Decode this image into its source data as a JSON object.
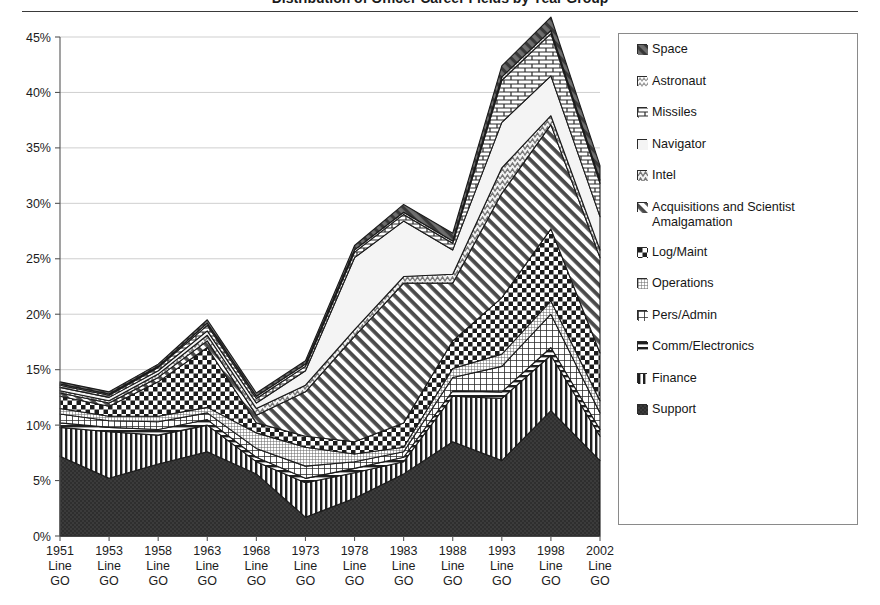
{
  "title": "Distribution of Officer Career Fields by Year Group",
  "yaxis": {
    "ticks": [
      "0%",
      "5%",
      "10%",
      "15%",
      "20%",
      "25%",
      "30%",
      "35%",
      "40%",
      "45%"
    ],
    "min": 0,
    "max": 45
  },
  "xaxis": {
    "ticks": [
      {
        "year": "1951",
        "line1": "Line",
        "line2": "GO"
      },
      {
        "year": "1953",
        "line1": "Line",
        "line2": "GO"
      },
      {
        "year": "1958",
        "line1": "Line",
        "line2": "GO"
      },
      {
        "year": "1963",
        "line1": "Line",
        "line2": "GO"
      },
      {
        "year": "1968",
        "line1": "Line",
        "line2": "GO"
      },
      {
        "year": "1973",
        "line1": "Line",
        "line2": "GO"
      },
      {
        "year": "1978",
        "line1": "Line",
        "line2": "GO"
      },
      {
        "year": "1983",
        "line1": "Line",
        "line2": "GO"
      },
      {
        "year": "1988",
        "line1": "Line",
        "line2": "GO"
      },
      {
        "year": "1993",
        "line1": "Line",
        "line2": "GO"
      },
      {
        "year": "1998",
        "line1": "Line",
        "line2": "GO"
      },
      {
        "year": "2002",
        "line1": "Line",
        "line2": "GO"
      }
    ]
  },
  "legend": {
    "items": [
      {
        "label": "Space",
        "pattern": "diag-dark-fill"
      },
      {
        "label": "Astronaut",
        "pattern": "zigzag-light"
      },
      {
        "label": "Missiles",
        "pattern": "brick"
      },
      {
        "label": "Navigator",
        "pattern": "solid-white"
      },
      {
        "label": "Intel",
        "pattern": "zigzag-grey"
      },
      {
        "label": "Acquisitions and Scientist\nAmalgamation",
        "pattern": "diag-stripe"
      },
      {
        "label": "Log/Maint",
        "pattern": "checker"
      },
      {
        "label": "Operations",
        "pattern": "grid-fine"
      },
      {
        "label": "Pers/Admin",
        "pattern": "grid-coarse"
      },
      {
        "label": "Comm/Electronics",
        "pattern": "horiz-stripe"
      },
      {
        "label": "Finance",
        "pattern": "vert-stripe"
      },
      {
        "label": "Support",
        "pattern": "solid-dark"
      }
    ]
  },
  "chart_data": {
    "type": "area",
    "stacked": true,
    "title": "Distribution of Officer Career Fields by Year Group",
    "xlabel": "",
    "ylabel": "",
    "ylim": [
      0,
      45
    ],
    "grid": true,
    "legend_position": "right",
    "categories": [
      "1951 Line GO",
      "1953 Line GO",
      "1958 Line GO",
      "1963 Line GO",
      "1968 Line GO",
      "1973 Line GO",
      "1978 Line GO",
      "1983 Line GO",
      "1988 Line GO",
      "1993 Line GO",
      "1998 Line GO",
      "2002 Line GO"
    ],
    "x": [
      "1951",
      "1953",
      "1958",
      "1963",
      "1968",
      "1973",
      "1978",
      "1983",
      "1988",
      "1993",
      "1998",
      "2002"
    ],
    "stack_order_bottom_to_top": [
      "Support",
      "Finance",
      "Comm/Electronics",
      "Pers/Admin",
      "Operations",
      "Log/Maint",
      "Acquisitions and Scientist Amalgamation",
      "Intel",
      "Navigator",
      "Missiles",
      "Astronaut",
      "Space"
    ],
    "series": [
      {
        "name": "Support",
        "values": [
          7.2,
          5.2,
          6.5,
          7.6,
          5.6,
          1.7,
          3.4,
          5.6,
          8.5,
          6.8,
          11.3,
          6.8
        ]
      },
      {
        "name": "Finance",
        "values": [
          2.6,
          4.2,
          2.6,
          2.4,
          1.1,
          3.1,
          2.3,
          1.1,
          4.1,
          5.6,
          5.0,
          2.2
        ]
      },
      {
        "name": "Comm/Electronics",
        "values": [
          0.4,
          0.4,
          0.5,
          0.5,
          0.4,
          0.4,
          0.4,
          0.4,
          0.5,
          0.6,
          0.7,
          0.6
        ]
      },
      {
        "name": "Pers/Admin",
        "values": [
          0.8,
          0.6,
          0.7,
          0.6,
          0.8,
          1.1,
          0.6,
          0.5,
          1.2,
          2.3,
          3.0,
          1.5
        ]
      },
      {
        "name": "Operations",
        "values": [
          0.5,
          0.4,
          0.5,
          0.5,
          1.4,
          1.7,
          0.7,
          0.4,
          0.8,
          1.1,
          1.2,
          1.1
        ]
      },
      {
        "name": "Log/Maint",
        "values": [
          1.1,
          0.9,
          3.1,
          5.4,
          0.9,
          1.0,
          1.1,
          2.2,
          2.5,
          5.1,
          6.5,
          4.3
        ]
      },
      {
        "name": "Acquisitions and Scientist Amalgamation",
        "values": [
          0.3,
          0.3,
          0.4,
          0.6,
          0.7,
          4.0,
          9.5,
          12.6,
          5.2,
          9.4,
          9.4,
          8.6
        ]
      },
      {
        "name": "Intel",
        "values": [
          0.2,
          0.2,
          0.3,
          0.5,
          0.6,
          0.6,
          0.6,
          0.6,
          0.8,
          2.3,
          0.8,
          0.7
        ]
      },
      {
        "name": "Navigator",
        "values": [
          0.3,
          0.3,
          0.3,
          0.4,
          0.5,
          1.3,
          6.5,
          5.0,
          2.2,
          4.1,
          3.6,
          3.0
        ]
      },
      {
        "name": "Missiles",
        "values": [
          0.2,
          0.2,
          0.3,
          0.5,
          0.4,
          0.4,
          0.5,
          0.6,
          0.6,
          3.8,
          3.8,
          3.0
        ]
      },
      {
        "name": "Astronaut",
        "values": [
          0.1,
          0.1,
          0.1,
          0.2,
          0.2,
          0.2,
          0.2,
          0.2,
          0.2,
          0.3,
          0.3,
          0.3
        ]
      },
      {
        "name": "Space",
        "values": [
          0.2,
          0.2,
          0.2,
          0.3,
          0.3,
          0.3,
          0.4,
          0.7,
          0.7,
          1.0,
          1.2,
          1.3
        ]
      }
    ],
    "totals": [
      13.9,
      13.0,
      15.5,
      19.5,
      12.9,
      15.8,
      26.2,
      29.9,
      27.3,
      42.4,
      46.8,
      33.4
    ]
  }
}
